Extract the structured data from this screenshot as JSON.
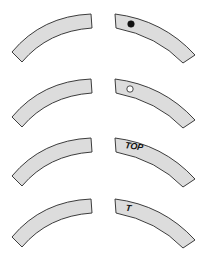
{
  "diagram": {
    "fill_color": "#dcdcdc",
    "stroke_color": "#3c3c3c",
    "rows": [
      {
        "id": "row-1",
        "marking_type": "filled-dot",
        "marking_label": ""
      },
      {
        "id": "row-2",
        "marking_type": "hollow-dot",
        "marking_label": ""
      },
      {
        "id": "row-3",
        "marking_type": "text",
        "marking_label": "TOP"
      },
      {
        "id": "row-4",
        "marking_type": "text",
        "marking_label": "T"
      }
    ]
  }
}
